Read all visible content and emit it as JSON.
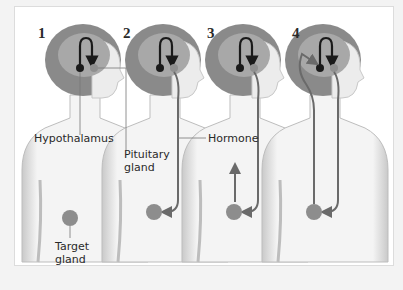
{
  "diagram": {
    "panels": [
      {
        "number": "1"
      },
      {
        "number": "2"
      },
      {
        "number": "3"
      },
      {
        "number": "4"
      }
    ],
    "labels": {
      "hypothalamus": "Hypothalamus",
      "pituitary_line1": "Pituitary",
      "pituitary_line2": "gland",
      "hormone": "Hormone",
      "target_line1": "Target",
      "target_line2": "gland"
    },
    "colors": {
      "hair": "#8a8a8a",
      "brain": "#a8a8a8",
      "skin_shade": "#d0d0d0",
      "arrow": "#6a6a6a",
      "hypothalamus_dot": "#1a1a1a",
      "pituitary_dot": "#8f8f8f",
      "target_gland": "#8d8d8d"
    }
  }
}
